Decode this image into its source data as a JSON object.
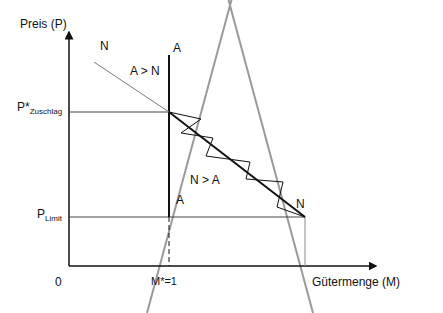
{
  "diagram": {
    "axes": {
      "y_label": "Preis (P)",
      "x_label": "Gütermenge (M)",
      "origin_label": "0"
    },
    "price_levels": {
      "p_star": {
        "main": "P*",
        "sub": "Zuschlag"
      },
      "p_limit": {
        "main": "P",
        "sub": "Limit"
      }
    },
    "quantity_marks": {
      "m_star": "M*=1"
    },
    "curves": {
      "supply_label_top": "A",
      "supply_label_bottom": "A",
      "demand_label_top": "N",
      "demand_label_bottom": "N"
    },
    "regions": {
      "excess_supply": "A > N",
      "excess_demand": "N > A"
    },
    "colors": {
      "axis": "#111111",
      "gray_lines": "#9a9a9a",
      "demand_line": "#777777"
    }
  }
}
